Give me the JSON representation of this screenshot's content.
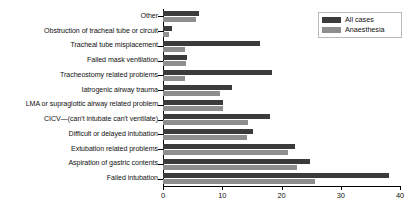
{
  "chart_data": {
    "type": "bar",
    "orientation": "horizontal",
    "title": "",
    "xlabel": "",
    "ylabel": "",
    "xlim": [
      0,
      40
    ],
    "xticks": [
      0,
      10,
      20,
      30,
      40
    ],
    "grid": false,
    "legend_position": "top-right",
    "categories": [
      "Other",
      "Obstruction of tracheal tube or circuit",
      "Tracheal tube misplacement",
      "Failed mask ventilation",
      "Tracheostomy related problems",
      "Iatrogenic airway trauma",
      "LMA or supraglottic airway related problem",
      "CICV—(can't intubate can't ventilate)",
      "Difficult or delayed intubation",
      "Extubation related problems",
      "Aspiration of gastric contents",
      "Failed intubation"
    ],
    "series": [
      {
        "name": "All cases",
        "color": "#3b3b3b",
        "values": [
          6.0,
          1.5,
          16.4,
          4.0,
          18.4,
          11.6,
          10.1,
          18.0,
          15.2,
          22.3,
          24.8,
          38.1
        ]
      },
      {
        "name": "Anaesthesia",
        "color": "#8e8e8e",
        "values": [
          5.6,
          1.0,
          3.7,
          3.9,
          3.7,
          9.6,
          10.1,
          14.3,
          14.2,
          21.1,
          22.6,
          25.6
        ]
      }
    ]
  },
  "legend": {
    "items": [
      {
        "label": "All cases"
      },
      {
        "label": "Anaesthesia"
      }
    ]
  }
}
